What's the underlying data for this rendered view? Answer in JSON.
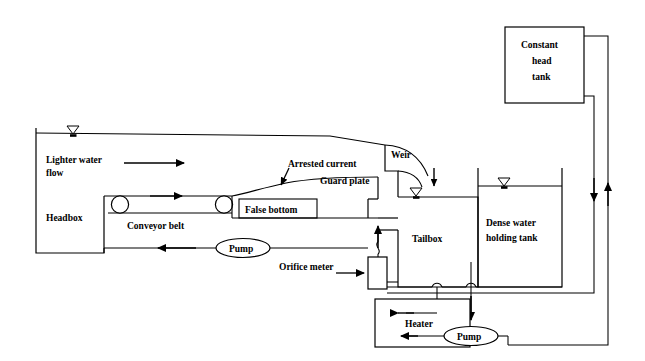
{
  "diagram": {
    "stroke_color": "#000000",
    "background_color": "#ffffff",
    "labels": {
      "headbox": "Headbox",
      "lighter_water_flow_line1": "Lighter water",
      "lighter_water_flow_line2": "flow",
      "conveyor_belt": "Conveyor belt",
      "false_bottom": "False bottom",
      "arrested_current": "Arrested current",
      "guard_plate": "Guard plate",
      "weir": "Weir",
      "tailbox": "Tailbox",
      "dense_water_line1": "Dense water",
      "dense_water_line2": "holding tank",
      "constant_head_line1": "Constant",
      "constant_head_line2": "head",
      "constant_head_line3": "tank",
      "pump_upper": "Pump",
      "pump_lower": "Pump",
      "orifice_meter": "Orifice meter",
      "heater": "Heater"
    },
    "components": [
      {
        "name": "headbox",
        "type": "vessel",
        "label": "Headbox"
      },
      {
        "name": "conveyor-belt",
        "type": "belt",
        "label": "Conveyor belt",
        "rollers": 2
      },
      {
        "name": "false-bottom",
        "type": "plate",
        "label": "False bottom"
      },
      {
        "name": "guard-plate",
        "type": "plate",
        "label": "Guard plate"
      },
      {
        "name": "weir",
        "type": "weir",
        "label": "Weir"
      },
      {
        "name": "tailbox",
        "type": "vessel",
        "label": "Tailbox"
      },
      {
        "name": "dense-water-holding-tank",
        "type": "vessel",
        "label": "Dense water holding tank"
      },
      {
        "name": "constant-head-tank",
        "type": "vessel",
        "label": "Constant head tank"
      },
      {
        "name": "heater",
        "type": "vessel",
        "label": "Heater"
      },
      {
        "name": "pump-upper",
        "type": "pump",
        "label": "Pump"
      },
      {
        "name": "pump-lower",
        "type": "pump",
        "label": "Pump"
      },
      {
        "name": "orifice-meter",
        "type": "instrument",
        "label": "Orifice meter"
      }
    ],
    "water_levels": [
      {
        "name": "headbox-water-level",
        "symbol": "free-surface-triangle"
      },
      {
        "name": "tailbox-water-level",
        "symbol": "free-surface-triangle"
      },
      {
        "name": "dense-water-tank-water-level",
        "symbol": "free-surface-triangle"
      }
    ],
    "flow_arrows": [
      {
        "name": "lighter-water-flow-arrow",
        "direction": "right"
      },
      {
        "name": "conveyor-top-arrow",
        "direction": "right"
      },
      {
        "name": "conveyor-return-arrow",
        "direction": "left"
      },
      {
        "name": "arrested-current-arrow",
        "direction": "down-left"
      },
      {
        "name": "weir-overflow-arrow",
        "direction": "down"
      },
      {
        "name": "orifice-meter-pointer-arrow",
        "direction": "right"
      },
      {
        "name": "riser-arrow",
        "direction": "up"
      },
      {
        "name": "right-downcomer-arrow",
        "direction": "down"
      },
      {
        "name": "right-riser-arrow",
        "direction": "up"
      },
      {
        "name": "heater-inlet-arrow",
        "direction": "right"
      },
      {
        "name": "heater-outlet-arrow",
        "direction": "left"
      },
      {
        "name": "pump-suction-arrow",
        "direction": "down"
      }
    ]
  }
}
